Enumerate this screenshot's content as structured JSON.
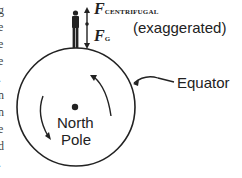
{
  "diagram": {
    "labels": {
      "f_centrifugal_main": "F",
      "f_centrifugal_sub": "CENTRIFUGAL",
      "f_gravity_main": "F",
      "f_gravity_sub": "G",
      "exaggerated": "(exaggerated)",
      "equator": "Equator",
      "north": "North",
      "pole": "Pole"
    },
    "left_edge_fragments": [
      "g",
      "e",
      "e",
      "e",
      ".",
      "n",
      "n",
      "e",
      "d",
      "."
    ],
    "colors": {
      "stroke": "#222222",
      "background": "#ffffff"
    }
  }
}
